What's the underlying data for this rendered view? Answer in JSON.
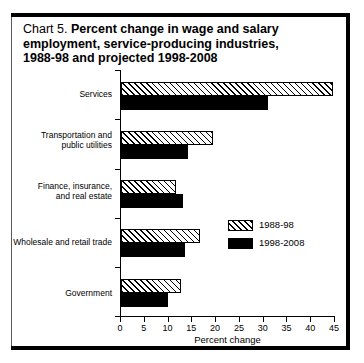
{
  "figure": {
    "label": "Chart 5.",
    "title_line1": "Percent change in wage and salary",
    "title_line2": "employment, service-producing industries,",
    "title_line3": "1988-98 and projected 1998-2008"
  },
  "legend": {
    "entries": [
      {
        "label": "1988-98",
        "swatch": "hatched-diagonal"
      },
      {
        "label": "1998-2008",
        "swatch": "solid-black"
      }
    ]
  },
  "axis": {
    "x_title": "Percent change",
    "x_ticks": [
      "0",
      "5",
      "10",
      "15",
      "20",
      "25",
      "30",
      "35",
      "40",
      "45"
    ]
  },
  "chart_data": {
    "type": "bar",
    "orientation": "horizontal",
    "title": "Chart 5. Percent change in wage and salary employment, service-producing industries, 1988-98 and projected 1998-2008",
    "xlabel": "Percent change",
    "ylabel": "",
    "xlim": [
      0,
      45
    ],
    "xticks": [
      0,
      5,
      10,
      15,
      20,
      25,
      30,
      35,
      40,
      45
    ],
    "grid": false,
    "legend_position": "inside-right-middle",
    "categories": [
      "Services",
      "Transportation and public utilities",
      "Finance, insurance, and real estate",
      "Wholesale and retail trade",
      "Government"
    ],
    "category_labels_wrapped": [
      [
        "Services"
      ],
      [
        "Transportation and",
        "public utilities"
      ],
      [
        "Finance, insurance,",
        "and real estate"
      ],
      [
        "Wholesale and retail trade"
      ],
      [
        "Government"
      ]
    ],
    "series": [
      {
        "name": "1988-98",
        "style": "hatched",
        "color": "#ffffff",
        "values": [
          44.5,
          19.3,
          11.6,
          16.6,
          12.6
        ]
      },
      {
        "name": "1998-2008",
        "style": "solid",
        "color": "#000000",
        "values": [
          31.0,
          14.1,
          13.0,
          13.4,
          9.8
        ]
      }
    ]
  }
}
